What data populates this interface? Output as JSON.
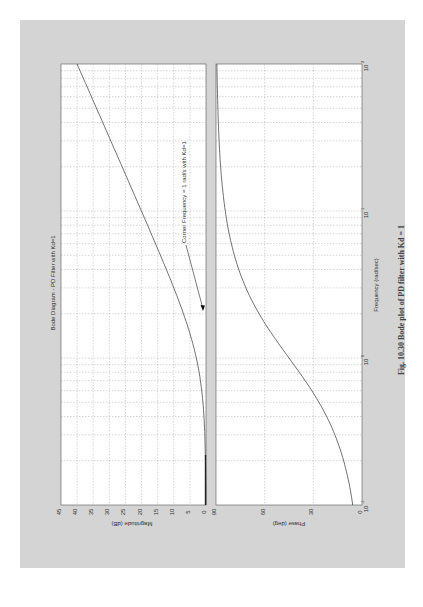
{
  "figure": {
    "caption": "Fig. 10.30 Bode plot of PD filter with Kd = 1",
    "background": "#d4d4d4",
    "orientation": "rotated 90 degrees (landscape plot on portrait page)"
  },
  "chart_data": [
    {
      "type": "line",
      "title": "Bode Diagram - PD Filter with Kd=1",
      "xlabel": "Frequency (rad/sec)",
      "ylabel": "Magnitude (dB)",
      "xscale": "log",
      "xlim": [
        0.1,
        100
      ],
      "ylim": [
        0,
        45
      ],
      "xticks": [
        "10^-1",
        "10^0",
        "10^1",
        "10^2"
      ],
      "yticks": [
        0,
        5,
        10,
        15,
        20,
        25,
        30,
        35,
        40,
        45
      ],
      "grid": true,
      "series": [
        {
          "name": "Magnitude",
          "x": [
            0.1,
            0.2,
            0.3,
            0.5,
            0.7,
            1,
            2,
            3,
            5,
            7,
            10,
            20,
            30,
            50,
            70,
            100
          ],
          "values": [
            0.04,
            0.17,
            0.37,
            0.97,
            1.73,
            3.01,
            6.99,
            10.0,
            14.15,
            17.0,
            20.04,
            26.03,
            29.55,
            33.98,
            36.9,
            40.0
          ]
        }
      ],
      "annotation": {
        "text": "Corner Frequency = 1 rad/s with Kd=1",
        "arrow_to": [
          1,
          3
        ]
      }
    },
    {
      "type": "line",
      "title": "",
      "xlabel": "Frequency (rad/sec)",
      "ylabel": "Phase (deg)",
      "xscale": "log",
      "xlim": [
        0.1,
        100
      ],
      "ylim": [
        0,
        90
      ],
      "xticks": [
        "10^-1",
        "10^0",
        "10^1",
        "10^2"
      ],
      "yticks": [
        0,
        30,
        60,
        90
      ],
      "grid": true,
      "series": [
        {
          "name": "Phase",
          "x": [
            0.1,
            0.2,
            0.3,
            0.5,
            0.7,
            1,
            2,
            3,
            5,
            7,
            10,
            20,
            30,
            50,
            70,
            100
          ],
          "values": [
            5.7,
            11.3,
            16.7,
            26.6,
            35.0,
            45.0,
            63.4,
            71.6,
            78.7,
            81.9,
            84.3,
            87.1,
            88.1,
            88.9,
            89.2,
            89.4
          ]
        }
      ]
    }
  ],
  "labels": {
    "title": "Bode Diagram - PD Filter with Kd=1",
    "mag_ylabel": "Magnitude (dB)",
    "phase_ylabel": "Phase (deg)",
    "xlabel": "Frequency (rad/sec)",
    "annotation": "Corner Frequency = 1 rad/s with Kd=1",
    "mag_ticks": [
      "45",
      "40",
      "35",
      "30",
      "25",
      "20",
      "15",
      "10",
      "5",
      "0"
    ],
    "phase_ticks": [
      "90",
      "60",
      "30",
      "0"
    ],
    "x_ticks": [
      "10",
      "10",
      "10",
      "10"
    ],
    "x_exps": [
      "-1",
      "0",
      "1",
      "2"
    ]
  }
}
